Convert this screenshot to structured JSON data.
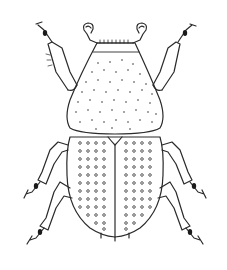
{
  "figure": {
    "subject": "beetle line drawing, dorsal view",
    "colors": {
      "ink": "#2a2a2a",
      "background": "#ffffff",
      "dark_tarsi": "#1a1a1a"
    },
    "parts": {
      "head": "head with antennae",
      "pronotum": "pronotum with scattered punctures",
      "elytra": "elytra with rows of punctures",
      "legs": [
        "front-left leg",
        "front-right leg",
        "middle-left leg",
        "middle-right leg",
        "hind-left leg",
        "hind-right leg"
      ]
    }
  }
}
